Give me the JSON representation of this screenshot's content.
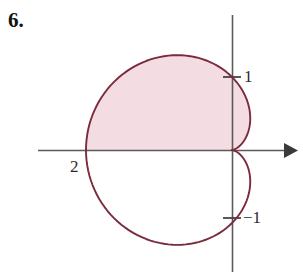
{
  "figure": {
    "problem_number": "6.",
    "width": 303,
    "height": 279,
    "background_color": "#ffffff"
  },
  "labels": {
    "y_positive": "1",
    "y_negative": "−1",
    "x_left_vertex": "2",
    "top_cropped_text": ""
  },
  "colors": {
    "curve": "#7a2b3c",
    "fill": "#f3dde2",
    "axis": "#5a5a5a",
    "text": "#1a1a1a"
  },
  "axes": {
    "origin_x": 232,
    "origin_y": 150,
    "x_axis_start_x": 38,
    "x_axis_end_x": 297,
    "y_axis_start_y": 15,
    "y_axis_end_y": 272,
    "x_arrow": "arrow-right",
    "tick_positive_one_y": 77,
    "tick_negative_one_y": 218,
    "unit_pixels": 73
  },
  "chart_data": {
    "type": "line",
    "title": "",
    "subtitle": "",
    "xlabel": "",
    "ylabel": "",
    "curve_name": "cardioid",
    "polar_equation": "r = 1 - cos(theta)",
    "scale_r_units": 1,
    "shaded_region": "upper half of cardioid (0 <= theta <= pi)",
    "shaded": true,
    "grid": false,
    "legend": null,
    "xlim": [
      -2.7,
      0.9
    ],
    "ylim": [
      -1.85,
      1.85
    ],
    "key_points": [
      {
        "label": "cusp at origin",
        "x": 0,
        "y": 0,
        "theta_deg": 0,
        "r": 0
      },
      {
        "label": "y-intercept upper",
        "x": 0,
        "y": 1,
        "theta_deg": 90,
        "r": 1
      },
      {
        "label": "y-intercept lower",
        "x": 0,
        "y": -1,
        "theta_deg": 270,
        "r": 1
      },
      {
        "label": "left vertex",
        "x": -2,
        "y": 0,
        "theta_deg": 180,
        "r": 2
      }
    ],
    "tick_labels": [
      "1",
      "−1",
      "2"
    ],
    "annotations": [
      {
        "text": "1",
        "at": [
          0,
          1
        ]
      },
      {
        "text": "−1",
        "at": [
          0,
          -1
        ]
      },
      {
        "text": "2",
        "at": [
          -2,
          0
        ]
      }
    ],
    "theta_samples_deg": [
      0,
      15,
      30,
      45,
      60,
      75,
      90,
      105,
      120,
      135,
      150,
      165,
      180,
      195,
      210,
      225,
      240,
      255,
      270,
      285,
      300,
      315,
      330,
      345,
      360
    ],
    "r_values": [
      0.0,
      0.034,
      0.134,
      0.293,
      0.5,
      0.741,
      1.0,
      1.259,
      1.5,
      1.707,
      1.866,
      1.966,
      2.0,
      1.966,
      1.866,
      1.707,
      1.5,
      1.259,
      1.0,
      0.741,
      0.5,
      0.293,
      0.134,
      0.034,
      0.0
    ]
  }
}
